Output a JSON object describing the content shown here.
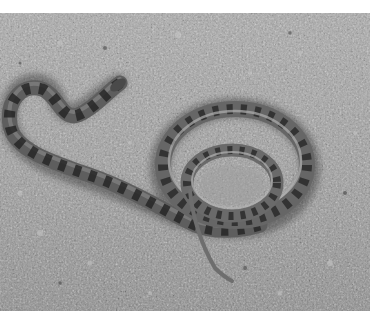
{
  "image": {
    "subject": "snake coiled on gravel",
    "style": "black-and-white photograph",
    "colors": {
      "background": "#ffffff",
      "gravel_light": "#b8b8b8",
      "gravel_mid": "#8f8f8f",
      "gravel_dark": "#555555",
      "snake_body": "#6a6a6a",
      "snake_blotch": "#2a2a2a",
      "snake_belly": "#a8a8a8"
    }
  }
}
